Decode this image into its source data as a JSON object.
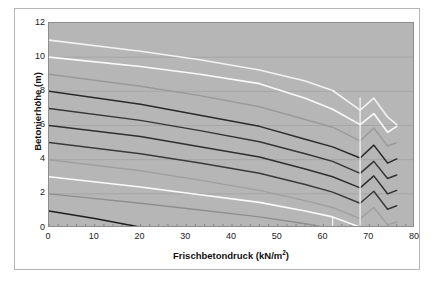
{
  "chart_data": {
    "type": "line",
    "title": "",
    "xlabel": "Frischbetondruck (kN/m2)",
    "xlabel_main": "Frischbetondruck (kN/m",
    "xlabel_sup": "2",
    "xlabel_tail": ")",
    "ylabel": "Betonierhöhe (m)",
    "xlim": [
      0,
      80
    ],
    "ylim": [
      0,
      12
    ],
    "xticks": [
      0,
      10,
      20,
      30,
      40,
      50,
      60,
      70,
      80
    ],
    "yticks": [
      0,
      2,
      4,
      6,
      8,
      10,
      12
    ],
    "grid": "horizontal",
    "legend": "none",
    "plot_bg": "#b6b6b6",
    "series": [
      {
        "name": "h=11m",
        "color": "#f2f2f2",
        "width": 1.6,
        "values": [
          [
            0,
            11.0
          ],
          [
            20,
            10.35
          ],
          [
            33,
            9.85
          ],
          [
            46,
            9.25
          ],
          [
            56,
            8.6
          ],
          [
            62,
            8.05
          ],
          [
            68,
            6.9
          ],
          [
            71,
            7.6
          ],
          [
            74,
            6.5
          ],
          [
            76,
            6.05
          ]
        ]
      },
      {
        "name": "h=10m",
        "color": "#fafafa",
        "width": 1.6,
        "values": [
          [
            0,
            10.0
          ],
          [
            20,
            9.45
          ],
          [
            33,
            9.0
          ],
          [
            46,
            8.45
          ],
          [
            56,
            7.6
          ],
          [
            62,
            6.95
          ],
          [
            68,
            6.05
          ],
          [
            71,
            6.7
          ],
          [
            74,
            5.6
          ],
          [
            76,
            5.95
          ]
        ]
      },
      {
        "name": "h=9m",
        "color": "#9a9a9a",
        "width": 1.4,
        "values": [
          [
            0,
            9.0
          ],
          [
            20,
            8.3
          ],
          [
            33,
            7.75
          ],
          [
            46,
            7.1
          ],
          [
            56,
            6.35
          ],
          [
            62,
            5.9
          ],
          [
            68,
            5.1
          ],
          [
            71,
            5.85
          ],
          [
            74,
            4.8
          ],
          [
            76,
            5.0
          ]
        ]
      },
      {
        "name": "h=8m",
        "color": "#2a2a2a",
        "width": 1.5,
        "values": [
          [
            0,
            8.0
          ],
          [
            20,
            7.25
          ],
          [
            33,
            6.6
          ],
          [
            46,
            5.95
          ],
          [
            56,
            5.2
          ],
          [
            62,
            4.75
          ],
          [
            68,
            4.1
          ],
          [
            71,
            4.85
          ],
          [
            74,
            3.8
          ],
          [
            76,
            4.05
          ]
        ]
      },
      {
        "name": "h=7m",
        "color": "#353535",
        "width": 1.5,
        "values": [
          [
            0,
            7.0
          ],
          [
            20,
            6.3
          ],
          [
            33,
            5.7
          ],
          [
            46,
            5.05
          ],
          [
            56,
            4.35
          ],
          [
            62,
            3.9
          ],
          [
            68,
            3.2
          ],
          [
            71,
            3.9
          ],
          [
            74,
            2.9
          ],
          [
            76,
            3.1
          ]
        ]
      },
      {
        "name": "h=6m",
        "color": "#2f2f2f",
        "width": 1.5,
        "values": [
          [
            0,
            6.0
          ],
          [
            20,
            5.35
          ],
          [
            33,
            4.75
          ],
          [
            46,
            4.15
          ],
          [
            56,
            3.45
          ],
          [
            62,
            3.0
          ],
          [
            68,
            2.35
          ],
          [
            71,
            3.05
          ],
          [
            74,
            2.0
          ],
          [
            76,
            2.2
          ]
        ]
      },
      {
        "name": "h=5m",
        "color": "#3a3a3a",
        "width": 1.5,
        "values": [
          [
            0,
            5.0
          ],
          [
            20,
            4.35
          ],
          [
            33,
            3.8
          ],
          [
            46,
            3.2
          ],
          [
            56,
            2.55
          ],
          [
            62,
            2.1
          ],
          [
            68,
            1.45
          ],
          [
            71,
            2.15
          ],
          [
            74,
            1.1
          ],
          [
            76,
            1.3
          ]
        ]
      },
      {
        "name": "h=4m",
        "color": "#a0a0a0",
        "width": 1.4,
        "values": [
          [
            0,
            4.0
          ],
          [
            20,
            3.35
          ],
          [
            33,
            2.8
          ],
          [
            46,
            2.2
          ],
          [
            56,
            1.6
          ],
          [
            62,
            1.2
          ],
          [
            68,
            0.55
          ],
          [
            71,
            1.2
          ],
          [
            74,
            0.2
          ],
          [
            76,
            0.35
          ]
        ]
      },
      {
        "name": "h=3m",
        "color": "#fbfbfb",
        "width": 1.6,
        "values": [
          [
            0,
            3.0
          ],
          [
            20,
            2.4
          ],
          [
            33,
            1.95
          ],
          [
            46,
            1.5
          ],
          [
            56,
            1.0
          ],
          [
            62,
            0.65
          ],
          [
            68,
            0.05
          ],
          [
            71,
            0.05
          ],
          [
            74,
            0.0
          ],
          [
            76,
            0.0
          ]
        ]
      },
      {
        "name": "h=2m",
        "color": "#8f8f8f",
        "width": 1.4,
        "values": [
          [
            0,
            2.0
          ],
          [
            20,
            1.45
          ],
          [
            33,
            1.05
          ],
          [
            46,
            0.65
          ],
          [
            56,
            0.25
          ],
          [
            61,
            0.0
          ]
        ]
      },
      {
        "name": "h=1m",
        "color": "#1f1f1f",
        "width": 1.5,
        "values": [
          [
            0,
            1.0
          ],
          [
            10,
            0.55
          ],
          [
            21,
            0.0
          ]
        ]
      },
      {
        "name": "vertical-marker-68",
        "color": "#f2f2f2",
        "width": 1.3,
        "values": [
          [
            68,
            0.0
          ],
          [
            68,
            7.6
          ]
        ]
      },
      {
        "name": "vertical-marker-62",
        "color": "#f6f6f6",
        "width": 1.3,
        "values": [
          [
            62,
            0.0
          ],
          [
            62,
            0.62
          ]
        ]
      }
    ]
  }
}
